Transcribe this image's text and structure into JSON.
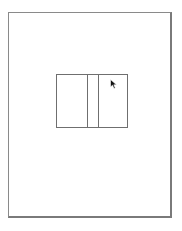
{
  "document": {
    "page_border_color": "#8a8a8a",
    "figure": {
      "type": "three-panel-box",
      "panels": [
        {
          "name": "left",
          "label": ""
        },
        {
          "name": "middle",
          "label": ""
        },
        {
          "name": "right",
          "label": ""
        }
      ],
      "line_color": "#6f6f6f"
    }
  },
  "cursor": {
    "icon": "arrow-pointer-icon",
    "x": 110,
    "y": 75
  }
}
